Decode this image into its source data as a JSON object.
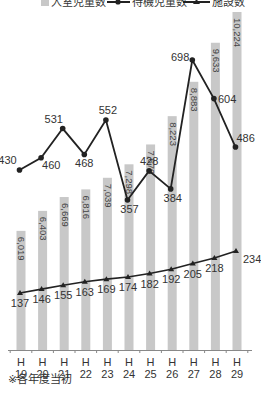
{
  "chart_data": {
    "type": "bar",
    "title": "",
    "xlabel": "",
    "ylabel": "",
    "categories": [
      "H19",
      "H20",
      "H21",
      "H22",
      "H23",
      "H24",
      "H25",
      "H26",
      "H27",
      "H28",
      "H29"
    ],
    "category_lines": [
      [
        "H",
        "19"
      ],
      [
        "H",
        "20"
      ],
      [
        "H",
        "21"
      ],
      [
        "H",
        "22"
      ],
      [
        "H",
        "23"
      ],
      [
        "H",
        "24"
      ],
      [
        "H",
        "25"
      ],
      [
        "H",
        "26"
      ],
      [
        "H",
        "27"
      ],
      [
        "H",
        "28"
      ],
      [
        "H",
        "29"
      ]
    ],
    "series": [
      {
        "name": "入室児童数",
        "kind": "bar",
        "color": "#c8c8c8",
        "values": [
          6019,
          6403,
          6669,
          6816,
          7039,
          7298,
          7679,
          8223,
          8883,
          9633,
          10224
        ],
        "labels": [
          "6,019",
          "6,403",
          "6,669",
          "6,816",
          "7,039",
          "7,298",
          "7,679",
          "8,223",
          "8,883",
          "9,633",
          "10,224"
        ]
      },
      {
        "name": "待機児童数",
        "kind": "line",
        "marker": "circle",
        "color": "#222222",
        "values": [
          430,
          460,
          531,
          468,
          552,
          357,
          428,
          384,
          698,
          604,
          486
        ]
      },
      {
        "name": "施設数",
        "kind": "line",
        "marker": "triangle",
        "color": "#222222",
        "values": [
          137,
          146,
          155,
          163,
          169,
          174,
          182,
          192,
          205,
          218,
          234
        ]
      }
    ],
    "legend_position": "top",
    "grid": false
  },
  "legend": {
    "items": [
      "入室児童数",
      "待機児童数",
      "施設数"
    ]
  },
  "note": "※各年度当初"
}
